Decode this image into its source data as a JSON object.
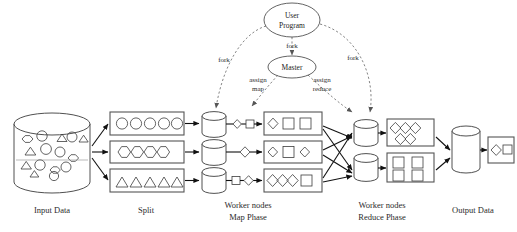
{
  "diagram": {
    "captions": [
      {
        "id": "input-data",
        "text": "Input Data",
        "x": 52,
        "y": 213
      },
      {
        "id": "split",
        "text": "Split",
        "x": 146,
        "y": 213
      },
      {
        "id": "worker-map-1",
        "text": "Worker nodes",
        "x": 248,
        "y": 208
      },
      {
        "id": "worker-map-2",
        "text": "Map Phase",
        "x": 248,
        "y": 220
      },
      {
        "id": "worker-reduce-1",
        "text": "Worker nodes",
        "x": 382,
        "y": 208
      },
      {
        "id": "worker-reduce-2",
        "text": "Reduce Phase",
        "x": 382,
        "y": 220
      },
      {
        "id": "output-data",
        "text": "Output Data",
        "x": 473,
        "y": 213
      }
    ],
    "nodes": [
      {
        "id": "user-program",
        "lines": [
          "User",
          "Program"
        ],
        "cx": 292,
        "cy": 20,
        "rx": 28,
        "ry": 17
      },
      {
        "id": "master",
        "lines": [
          "Master"
        ],
        "cx": 292,
        "cy": 67,
        "rx": 24,
        "ry": 11
      }
    ],
    "edge_labels": [
      {
        "id": "fork-left",
        "text": "fork",
        "x": 224,
        "y": 62
      },
      {
        "id": "fork-center",
        "text": "fork",
        "x": 292,
        "y": 48
      },
      {
        "id": "fork-right",
        "text": "fork",
        "x": 353,
        "y": 60
      },
      {
        "id": "assign-map-1",
        "text": "assign",
        "x": 258,
        "y": 82
      },
      {
        "id": "assign-map-2",
        "text": "map",
        "x": 258,
        "y": 91
      },
      {
        "id": "assign-reduce-1",
        "text": "assign",
        "x": 322,
        "y": 82
      },
      {
        "id": "assign-reduce-2",
        "text": "reduce",
        "x": 322,
        "y": 91
      }
    ],
    "input_store": {
      "id": "input-cylinder",
      "shape_counts": {
        "circle": 9,
        "hexagon": 4,
        "triangle": 5
      }
    },
    "splits": [
      {
        "id": "split-1",
        "shape": "circle",
        "count": 5
      },
      {
        "id": "split-2",
        "shape": "hexagon",
        "count": 4
      },
      {
        "id": "split-3",
        "shape": "triangle",
        "count": 5
      }
    ],
    "map_workers": [
      {
        "id": "map-worker-1",
        "intermediate": [
          "diamond",
          "square"
        ],
        "output": [
          "diamond",
          "square",
          "square"
        ]
      },
      {
        "id": "map-worker-2",
        "intermediate": [
          "diamond"
        ],
        "output": [
          "diamond",
          "square",
          "diamond"
        ]
      },
      {
        "id": "map-worker-3",
        "intermediate": [
          "square",
          "diamond"
        ],
        "output": [
          "diamond",
          "diamond",
          "square"
        ]
      }
    ],
    "reduce_workers": [
      {
        "id": "reduce-worker-1",
        "output_shape": "diamond",
        "output_count": 5
      },
      {
        "id": "reduce-worker-2",
        "output_shape": "square",
        "output_count": 4
      }
    ],
    "output_store": {
      "id": "output-cylinder",
      "result_shapes": [
        "diamond",
        "square"
      ]
    },
    "colors": {
      "stroke": "#3c3c3c",
      "arrow_solid": "#111111",
      "arrow_dashed": "#777777",
      "box_stroke": "#555555",
      "text": "#2b2b2b",
      "background": "#ffffff"
    }
  }
}
